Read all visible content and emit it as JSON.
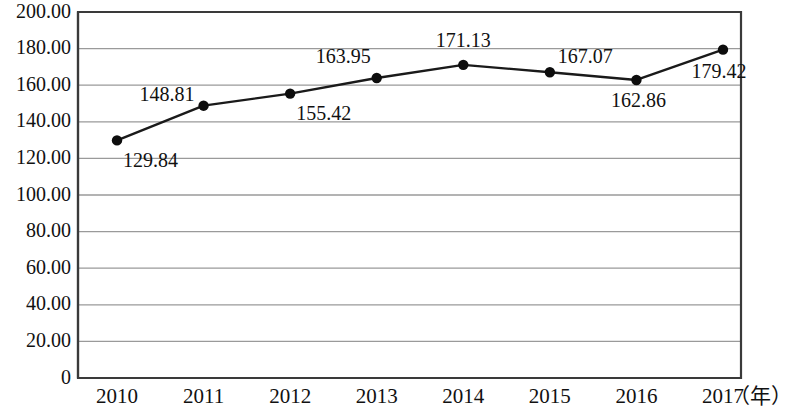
{
  "chart_data": {
    "type": "line",
    "title": "",
    "subtitle": "",
    "xlabel": "（年）",
    "ylabel": "",
    "categories": [
      "2010",
      "2011",
      "2012",
      "2013",
      "2014",
      "2015",
      "2016",
      "2017"
    ],
    "values": [
      129.84,
      148.81,
      155.42,
      163.95,
      171.13,
      167.07,
      162.86,
      179.42
    ],
    "point_labels": [
      "129.84",
      "148.81",
      "155.42",
      "163.95",
      "171.13",
      "167.07",
      "162.86",
      "179.42"
    ],
    "series": [
      {
        "name": "",
        "values": [
          129.84,
          148.81,
          155.42,
          163.95,
          171.13,
          167.07,
          162.86,
          179.42
        ]
      }
    ],
    "ylim": [
      0,
      200
    ],
    "ytick_step": 20,
    "ytick_labels": [
      "200.00",
      "180.00",
      "160.00",
      "140.00",
      "120.00",
      "100.00",
      "80.00",
      "60.00",
      "40.00",
      "20.00",
      "0"
    ],
    "ytick_values": [
      200,
      180,
      160,
      140,
      120,
      100,
      80,
      60,
      40,
      20,
      0
    ],
    "xtick_labels": [
      "2010",
      "2011",
      "2012",
      "2013",
      "2014",
      "2015",
      "2016",
      "2017"
    ],
    "grid": true,
    "grid_axis": "y",
    "legend": false,
    "legend_position": "none",
    "marker": "circle",
    "line_color": "#1a1a1a",
    "marker_color": "#0d0d0d",
    "grid_color": "#9a9a9a",
    "frame_color": "#3a3a3a",
    "background_color": "#ffffff",
    "label_placement": [
      "below-right",
      "left",
      "below-right",
      "above-left",
      "above",
      "above-right",
      "below",
      "below-right"
    ]
  }
}
